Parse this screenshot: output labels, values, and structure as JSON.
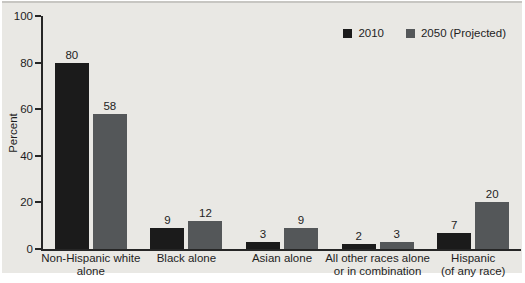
{
  "figure": {
    "panel_background": "#e9e8e4",
    "top_rule_color": "#c7c6c2",
    "axis_color": "#262626",
    "text_color": "#1e1e1e"
  },
  "chart_data": {
    "type": "bar",
    "title": "",
    "xlabel": "",
    "ylabel": "Percent",
    "ylim": [
      0,
      100
    ],
    "yticks": [
      0,
      20,
      40,
      60,
      80,
      100
    ],
    "grid": false,
    "legend_position": "top-right",
    "categories": [
      "Non-Hispanic white alone",
      "Black alone",
      "Asian alone",
      "All other races alone or in combination",
      "Hispanic (of any race)"
    ],
    "category_label_lines": [
      [
        "Non-Hispanic white",
        "alone"
      ],
      [
        "Black alone"
      ],
      [
        "Asian alone"
      ],
      [
        "All other races alone",
        "or in combination"
      ],
      [
        "Hispanic",
        "(of any race)"
      ]
    ],
    "series": [
      {
        "name": "2010",
        "color": "#1b1b1b",
        "values": [
          80,
          9,
          3,
          2,
          7
        ]
      },
      {
        "name": "2050 (Projected)",
        "color": "#545759",
        "values": [
          58,
          12,
          9,
          3,
          20
        ]
      }
    ]
  }
}
